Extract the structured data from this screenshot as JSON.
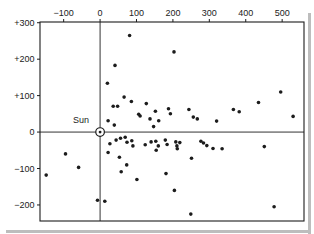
{
  "figure": {
    "sun_label": "Sun"
  },
  "colors": {
    "ink": "#1c1c1c",
    "background": "#ffffff",
    "scan_edge": "#bdbdbd"
  },
  "chart_data": {
    "type": "scatter",
    "title": "",
    "xlabel": "",
    "ylabel": "",
    "legend": "none",
    "grid": "crosshair through origin only",
    "x_axis_position": "top",
    "y_axis_position": "left",
    "xlim": [
      -165,
      560
    ],
    "ylim": [
      -244,
      302
    ],
    "x_tick_values": [
      -100,
      0,
      100,
      200,
      300,
      400,
      500
    ],
    "x_tick_labels": [
      "−100",
      "0",
      "100",
      "200",
      "300",
      "400",
      "500"
    ],
    "y_tick_values": [
      300,
      200,
      100,
      0,
      -100,
      -200
    ],
    "y_tick_labels": [
      "+300",
      "+200",
      "+100",
      "0",
      "−100",
      "−200"
    ],
    "sun": {
      "x": 0,
      "y": 0,
      "label": "Sun"
    },
    "points": [
      [
        81,
        265
      ],
      [
        203,
        220
      ],
      [
        41,
        183
      ],
      [
        20,
        134
      ],
      [
        66,
        96
      ],
      [
        86,
        84
      ],
      [
        36,
        71
      ],
      [
        48,
        71
      ],
      [
        127,
        78
      ],
      [
        152,
        57
      ],
      [
        188,
        64
      ],
      [
        193,
        50
      ],
      [
        106,
        49
      ],
      [
        110,
        44
      ],
      [
        137,
        36
      ],
      [
        161,
        31
      ],
      [
        22,
        31
      ],
      [
        39,
        19
      ],
      [
        147,
        15
      ],
      [
        244,
        62
      ],
      [
        256,
        41
      ],
      [
        267,
        36
      ],
      [
        320,
        30
      ],
      [
        366,
        62
      ],
      [
        382,
        56
      ],
      [
        435,
        81
      ],
      [
        496,
        110
      ],
      [
        530,
        43
      ],
      [
        27,
        -32
      ],
      [
        44,
        -22
      ],
      [
        56,
        -17
      ],
      [
        69,
        -14
      ],
      [
        74,
        -28
      ],
      [
        87,
        -24
      ],
      [
        90,
        -38
      ],
      [
        124,
        -35
      ],
      [
        140,
        -27
      ],
      [
        153,
        -25
      ],
      [
        160,
        -38
      ],
      [
        154,
        -50
      ],
      [
        179,
        -22
      ],
      [
        184,
        -34
      ],
      [
        208,
        -27
      ],
      [
        211,
        -38
      ],
      [
        219,
        -29
      ],
      [
        277,
        -25
      ],
      [
        284,
        -30
      ],
      [
        293,
        -37
      ],
      [
        212,
        -46
      ],
      [
        310,
        -45
      ],
      [
        335,
        -46
      ],
      [
        451,
        -40
      ],
      [
        251,
        -72
      ],
      [
        22,
        -56
      ],
      [
        53,
        -69
      ],
      [
        73,
        -90
      ],
      [
        58,
        -109
      ],
      [
        101,
        -130
      ],
      [
        -95,
        -60
      ],
      [
        -59,
        -97
      ],
      [
        -148,
        -118
      ],
      [
        181,
        -114
      ],
      [
        204,
        -160
      ],
      [
        -7,
        -187
      ],
      [
        13,
        -190
      ],
      [
        249,
        -225
      ],
      [
        478,
        -205
      ]
    ]
  }
}
